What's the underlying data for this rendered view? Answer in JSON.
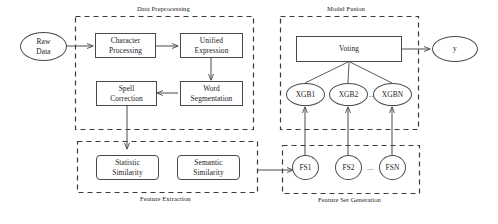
{
  "diagram": {
    "groups": [
      {
        "id": "data-preprocessing",
        "label": "Data Preprocessing",
        "label_position": "top"
      },
      {
        "id": "model-fusion",
        "label": "Model Fusion",
        "label_position": "top"
      },
      {
        "id": "feature-extraction",
        "label": "Feature Extraction",
        "label_position": "bottom"
      },
      {
        "id": "feature-set-generation",
        "label": "Feature Set Generation",
        "label_position": "bottom"
      }
    ],
    "nodes": {
      "raw_data": "Raw\nData",
      "raw_data_line1": "Raw",
      "raw_data_line2": "Data",
      "character_processing_line1": "Character",
      "character_processing_line2": "Processing",
      "unified_expression_line1": "Unified",
      "unified_expression_line2": "Expression",
      "word_segmentation_line1": "Word",
      "word_segmentation_line2": "Segmentation",
      "spell_correction_line1": "Spell",
      "spell_correction_line2": "Correction",
      "statistic_similarity_line1": "Statistic",
      "statistic_similarity_line2": "Similarity",
      "semantic_similarity_line1": "Semantic",
      "semantic_similarity_line2": "Similarity",
      "fs1": "FS1",
      "fs2": "FS2",
      "fsn": "FSN",
      "fs_ellipsis": "...",
      "xgb1": "XGB1",
      "xgb2": "XGB2",
      "xgbn": "XGBN",
      "xgb_ellipsis": "...",
      "voting": "Voting",
      "output": "y"
    },
    "colors": {
      "stroke": "#4a4a4a",
      "dashed_stroke": "#3a3a3a",
      "text": "#1a1a1a",
      "background": "#ffffff"
    }
  }
}
